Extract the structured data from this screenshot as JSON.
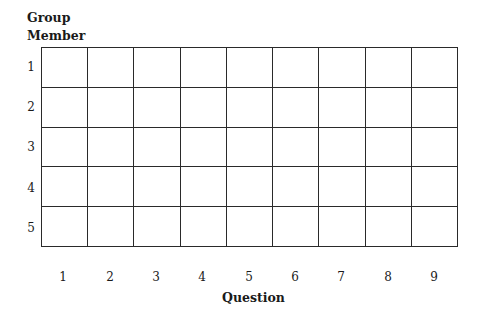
{
  "header": {
    "line1": "Group",
    "line2": "Member"
  },
  "rows": [
    "1",
    "2",
    "3",
    "4",
    "5"
  ],
  "columns": [
    "1",
    "2",
    "3",
    "4",
    "5",
    "6",
    "7",
    "8",
    "9"
  ],
  "x_title": "Question"
}
